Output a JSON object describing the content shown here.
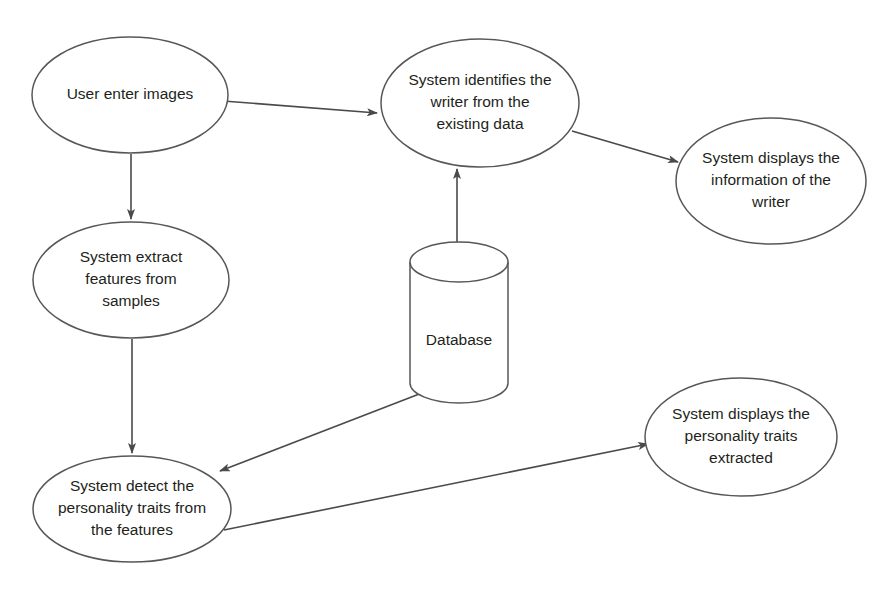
{
  "diagram": {
    "background_color": "#ffffff",
    "stroke_color": "#575757",
    "text_color": "#231f20",
    "nodes": [
      {
        "id": "user-enter-images",
        "shape": "ellipse",
        "lines": [
          "User enter images"
        ],
        "cx": 130,
        "cy": 95,
        "rx": 98,
        "ry": 58
      },
      {
        "id": "system-identifies-writer",
        "shape": "ellipse",
        "lines": [
          "System identifies the",
          "writer from the",
          "existing data"
        ],
        "cx": 480,
        "cy": 103,
        "rx": 99,
        "ry": 64
      },
      {
        "id": "system-displays-information",
        "shape": "ellipse",
        "lines": [
          "System displays the",
          "information of the",
          "writer"
        ],
        "cx": 771,
        "cy": 181,
        "rx": 95,
        "ry": 63
      },
      {
        "id": "system-extract-features",
        "shape": "ellipse",
        "lines": [
          "System extract",
          "features from",
          "samples"
        ],
        "cx": 131,
        "cy": 280,
        "rx": 98,
        "ry": 58
      },
      {
        "id": "database",
        "shape": "cylinder",
        "lines": [
          "Database"
        ],
        "cx": 459,
        "cy": 333,
        "rx": 49,
        "ry": 20,
        "top": 262,
        "bottom": 383
      },
      {
        "id": "system-detect-personality-traits",
        "shape": "ellipse",
        "lines": [
          "System detect the",
          "personality traits from",
          "the features"
        ],
        "cx": 132,
        "cy": 509,
        "rx": 99,
        "ry": 53
      },
      {
        "id": "system-displays-personality-traits",
        "shape": "ellipse",
        "lines": [
          "System displays the",
          "personality traits",
          "extracted"
        ],
        "cx": 741,
        "cy": 437,
        "rx": 96,
        "ry": 59
      }
    ],
    "edges": [
      {
        "id": "edge-user-to-identify",
        "from": "user-enter-images",
        "to": "system-identifies-writer",
        "x1": 223,
        "y1": 101,
        "x2": 377,
        "y2": 113
      },
      {
        "id": "edge-identify-to-display-info",
        "from": "system-identifies-writer",
        "to": "system-displays-information",
        "x1": 572,
        "y1": 131,
        "x2": 678,
        "y2": 162
      },
      {
        "id": "edge-user-to-extract",
        "from": "user-enter-images",
        "to": "system-extract-features",
        "x1": 131,
        "y1": 154,
        "x2": 131,
        "y2": 219
      },
      {
        "id": "edge-database-to-identify",
        "from": "database",
        "to": "system-identifies-writer",
        "x1": 457,
        "y1": 261,
        "x2": 457,
        "y2": 169
      },
      {
        "id": "edge-extract-to-detect",
        "from": "system-extract-features",
        "to": "system-detect-personality-traits",
        "x1": 132,
        "y1": 339,
        "x2": 132,
        "y2": 453
      },
      {
        "id": "edge-database-to-detect",
        "from": "database",
        "to": "system-detect-personality-traits",
        "x1": 427,
        "y1": 391,
        "x2": 220,
        "y2": 471
      },
      {
        "id": "edge-detect-to-display-traits",
        "from": "system-detect-personality-traits",
        "to": "system-displays-personality-traits",
        "x1": 224,
        "y1": 530,
        "x2": 648,
        "y2": 444
      }
    ]
  }
}
